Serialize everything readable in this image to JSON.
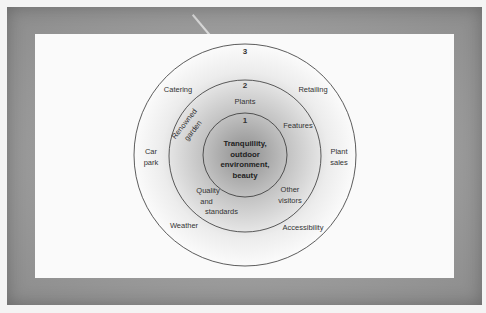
{
  "diagram": {
    "type": "concentric-circles",
    "rings": [
      {
        "number": "1",
        "core_label": [
          "Tranquillity,",
          "outdoor",
          "environment,",
          "beauty"
        ]
      },
      {
        "number": "2",
        "items": {
          "plants": "Plants",
          "renowned_garden": [
            "Renowned",
            "garden"
          ],
          "features": "Features",
          "quality": [
            "Quality",
            "and",
            "standards"
          ],
          "other_visitors": [
            "Other",
            "visitors"
          ]
        }
      },
      {
        "number": "3",
        "items": {
          "catering": "Catering",
          "retailing": "Retailing",
          "car_park": [
            "Car",
            "park"
          ],
          "plant_sales": [
            "Plant",
            "sales"
          ],
          "weather": "Weather",
          "accessibility": "Accessibility"
        }
      }
    ],
    "colors": {
      "frame": "#9a9a9a",
      "panel": "#fafafa",
      "circle_stroke": "#333333",
      "sphere_light": "#ffffff",
      "sphere_dark": "#9a9a9a"
    }
  }
}
